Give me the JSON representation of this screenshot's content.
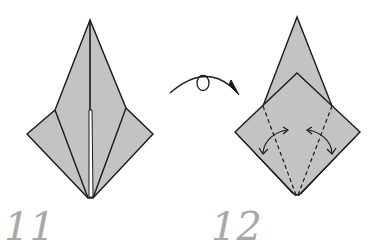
{
  "diagram": {
    "type": "origami-instructions",
    "colors": {
      "paper": "#c3c3c3",
      "line": "#1a1a1a",
      "step_number": "#a8a8a8",
      "background": "#ffffff"
    },
    "steps": [
      {
        "number": "11",
        "description": "Kite base with side flaps folded to center; narrow slit along vertical centerline"
      },
      {
        "number": "12",
        "description": "Model turned over; valley-fold both lower edges to center along dashed lines, then unfold",
        "symbols": [
          "valley-fold-dashed-lines",
          "fold-and-unfold-arrows"
        ]
      }
    ],
    "transition_symbol": "turn-over-arrow"
  }
}
